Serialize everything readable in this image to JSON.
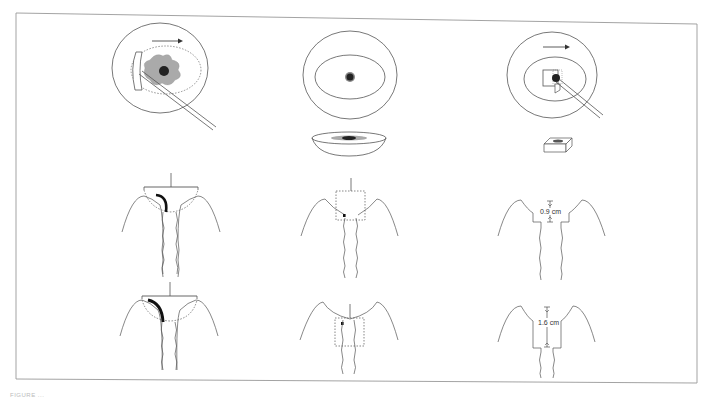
{
  "figure": {
    "layout": "3 columns x 3 rows",
    "colors": {
      "line": "#555555",
      "frame": "#888888",
      "lesion_fill": "#aaaaaa",
      "lesion_core": "#222222",
      "excision_mark": "#111111"
    },
    "columns": [
      {
        "id": "col1",
        "top_view": {
          "description": "Cervix face with loop electrode sweeping across a gray lesion with dark core; dotted ellipse marks transformation zone",
          "arrow_direction": "right"
        },
        "mid_profile": {
          "description": "Sagittal section with dome-shaped dotted excision outline and bold curved cut line on left"
        },
        "bottom_profile": {
          "description": "Sagittal section with larger dome-shaped dotted excision and bold curved cut line on left"
        }
      },
      {
        "id": "col2",
        "top_view": {
          "description": "Cervix face with concentric ellipse and small dark central lesion",
          "specimen": "Saucer-shaped excised specimen with central lesion"
        },
        "mid_profile": {
          "description": "Sagittal section with shallow rectangular dotted excision box and small dark mark"
        },
        "bottom_profile": {
          "description": "Sagittal section with deeper rectangular dotted excision box extending into canal"
        }
      },
      {
        "id": "col3",
        "top_view": {
          "description": "Cervix face with square excision probe over central lesion",
          "arrow_direction": "right",
          "specimen": "Box-shaped excised specimen"
        },
        "mid_profile": {
          "description": "Sagittal section with stepped rectangular excision",
          "measurement": "0.9 cm"
        },
        "bottom_profile": {
          "description": "Sagittal section with deeper stepped rectangular excision",
          "measurement": "1.6 cm"
        }
      }
    ],
    "caption": "FIGURE ..."
  }
}
